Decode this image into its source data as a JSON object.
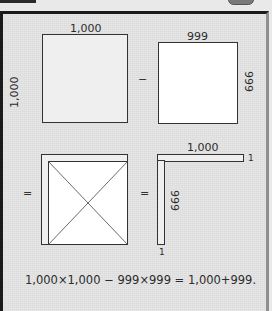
{
  "window": {
    "top_left_bar": "",
    "top_right_button": ""
  },
  "diagram": {
    "square_large": {
      "top_label": "1,000",
      "side_label": "1,000"
    },
    "operator_minus": "−",
    "square_small": {
      "top_label": "999",
      "side_label": "999"
    },
    "operator_equals_left": "=",
    "operator_equals_middle": "=",
    "l_shape": {
      "top_label": "1,000",
      "corner_label_right": "1",
      "side_label": "999",
      "corner_label_bottom": "1"
    },
    "formula": "1,000×1,000 − 999×999 = 1,000+999."
  },
  "colors": {
    "panel_bg": "#dcdcdc",
    "border_dark": "#1a1a1a",
    "line": "#333333",
    "fill_gray": "#efefef",
    "fill_white": "#ffffff"
  }
}
